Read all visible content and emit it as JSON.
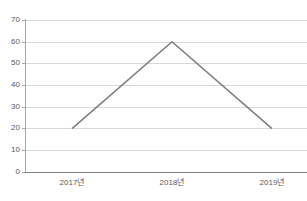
{
  "chart_data": {
    "type": "line",
    "title": "",
    "subtitle": "",
    "xlabel": "",
    "ylabel": "",
    "categories": [
      "2017년",
      "2018년",
      "2019년"
    ],
    "values": [
      20,
      60,
      20
    ],
    "series": [
      {
        "name": "",
        "values": [
          20,
          60,
          20
        ],
        "color": "#808080"
      }
    ],
    "ylim": [
      0,
      70
    ],
    "yticks": [
      0,
      10,
      20,
      30,
      40,
      50,
      60,
      70
    ],
    "ytick_labels": [
      "0",
      "10",
      "20",
      "30",
      "40",
      "50",
      "60",
      "70"
    ],
    "xtick_labels": [
      "2017년",
      "2018년",
      "2019년"
    ],
    "grid": true,
    "grid_axis": "y",
    "legend": false,
    "legend_position": "none",
    "markers": false,
    "annotations": []
  },
  "style": {
    "background": "#ffffff",
    "grid_color": "#d9d9d9",
    "axis_color": "#7f7f7f",
    "y_spine_color": "#a6a6a6",
    "tick_label_color": "#595959",
    "line_color": "#808080",
    "line_width": 1.6
  },
  "geometry": {
    "plot_left": 25,
    "plot_right": 307,
    "plot_top": 20,
    "plot_bottom": 172,
    "point_x": [
      72,
      172,
      272
    ],
    "point_y": [
      128,
      42,
      128
    ]
  }
}
